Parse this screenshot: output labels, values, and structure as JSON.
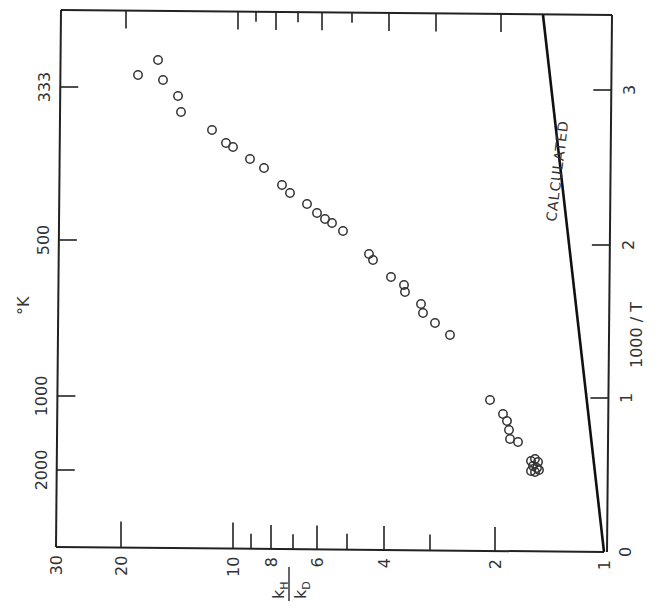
{
  "chart_data": {
    "type": "scatter",
    "orientation_note": "figure printed rotated 90 degrees counter-clockwise",
    "title": "",
    "xlabel": "1000/T",
    "ylabel": "kH/kD",
    "top_axis_label": "°K",
    "x_scale": "linear",
    "y_scale": "log",
    "xlim": [
      0,
      3.5
    ],
    "ylim": [
      1,
      30
    ],
    "x_ticks": [
      0,
      1,
      2,
      3
    ],
    "x_tick_labels": [
      "0",
      "1",
      "2",
      "3"
    ],
    "y_ticks": [
      1,
      2,
      3,
      4,
      5,
      6,
      7,
      8,
      9,
      10,
      20,
      30
    ],
    "y_tick_labels": [
      "1",
      "2",
      "",
      "4",
      "",
      "6",
      "",
      "8",
      "",
      "10",
      "20",
      "30"
    ],
    "secondary_x_ticks": [
      333,
      500,
      1000,
      2000
    ],
    "secondary_x_tick_labels": [
      "333",
      "500",
      "1000",
      "2000"
    ],
    "grid": false,
    "series": [
      {
        "name": "experimental",
        "marker": "open-circle",
        "points": [
          [
            3.1,
            18.0
          ],
          [
            3.19,
            15.9
          ],
          [
            3.06,
            15.4
          ],
          [
            2.96,
            14.1
          ],
          [
            2.86,
            13.8
          ],
          [
            2.74,
            11.4
          ],
          [
            2.66,
            10.4
          ],
          [
            2.63,
            10.0
          ],
          [
            2.55,
            9.0
          ],
          [
            2.49,
            8.3
          ],
          [
            2.38,
            7.4
          ],
          [
            2.33,
            7.0
          ],
          [
            2.26,
            6.3
          ],
          [
            2.2,
            5.9
          ],
          [
            2.16,
            5.7
          ],
          [
            2.14,
            5.4
          ],
          [
            2.08,
            5.1
          ],
          [
            1.94,
            4.3
          ],
          [
            1.9,
            4.2
          ],
          [
            1.79,
            3.75
          ],
          [
            1.73,
            3.46
          ],
          [
            1.69,
            3.44
          ],
          [
            1.61,
            3.11
          ],
          [
            1.55,
            3.08
          ],
          [
            1.49,
            2.85
          ],
          [
            1.41,
            2.6
          ],
          [
            0.99,
            2.03
          ],
          [
            0.9,
            1.87
          ],
          [
            0.85,
            1.83
          ],
          [
            0.79,
            1.8
          ],
          [
            0.73,
            1.79
          ],
          [
            0.71,
            1.71
          ],
          [
            0.6,
            1.58
          ],
          [
            0.58,
            1.54
          ],
          [
            0.57,
            1.61
          ],
          [
            0.55,
            1.56
          ],
          [
            0.54,
            1.52
          ],
          [
            0.53,
            1.59
          ],
          [
            0.52,
            1.55
          ],
          [
            0.56,
            1.5
          ]
        ]
      },
      {
        "name": "CALCULATED",
        "type": "line",
        "points": [
          [
            0,
            1.0
          ],
          [
            3.49,
            1.46
          ]
        ]
      }
    ],
    "annotations": [
      "CALCULATED"
    ]
  },
  "labels": {
    "y_axis_label_num": "k",
    "y_axis_label_num_sub": "H",
    "y_axis_label_den": "k",
    "y_axis_label_den_sub": "D",
    "x_axis_label": "1000 / T",
    "top_axis_label": "°K",
    "calculated": "CALCULATED"
  },
  "ticks": {
    "bottom": [
      {
        "label": "30",
        "x": 56,
        "len": 0
      },
      {
        "label": "20",
        "x": 121,
        "len": 26
      },
      {
        "label": "10",
        "x": 233,
        "len": 26
      },
      {
        "label": "",
        "x": 251,
        "len": 15
      },
      {
        "label": "8",
        "x": 271,
        "len": 24
      },
      {
        "label": "",
        "x": 293,
        "len": 15
      },
      {
        "label": "6",
        "x": 317,
        "len": 24
      },
      {
        "label": "",
        "x": 347,
        "len": 16
      },
      {
        "label": "4",
        "x": 384,
        "len": 24
      },
      {
        "label": "",
        "x": 430,
        "len": 16
      },
      {
        "label": "2",
        "x": 495,
        "len": 24
      },
      {
        "label": "1",
        "x": 604,
        "len": 0
      }
    ],
    "top": [
      {
        "x": 126,
        "len": 18
      },
      {
        "x": 238,
        "len": 18
      },
      {
        "x": 256,
        "len": 10
      },
      {
        "x": 276,
        "len": 18
      },
      {
        "x": 298,
        "len": 10
      },
      {
        "x": 322,
        "len": 18
      },
      {
        "x": 352,
        "len": 10
      },
      {
        "x": 389,
        "len": 18
      },
      {
        "x": 436,
        "len": 18
      },
      {
        "x": 501,
        "len": 18
      }
    ],
    "left": [
      {
        "label": "333",
        "y": 87
      },
      {
        "label": "500",
        "y": 240
      },
      {
        "label": "1000",
        "y": 396
      },
      {
        "label": "2000",
        "y": 470
      }
    ],
    "right": [
      {
        "label": "3",
        "y": 90
      },
      {
        "label": "2",
        "y": 245
      },
      {
        "label": "1",
        "y": 398
      },
      {
        "label": "0",
        "y": 552
      }
    ]
  },
  "points_px": [
    [
      138,
      75
    ],
    [
      158,
      60
    ],
    [
      163,
      80
    ],
    [
      178,
      96
    ],
    [
      181,
      112
    ],
    [
      212,
      130
    ],
    [
      226,
      143
    ],
    [
      233,
      147
    ],
    [
      250,
      159
    ],
    [
      264,
      168
    ],
    [
      282,
      185
    ],
    [
      290,
      193
    ],
    [
      307,
      204
    ],
    [
      317,
      213
    ],
    [
      325,
      219
    ],
    [
      332,
      223
    ],
    [
      343,
      231
    ],
    [
      369,
      254
    ],
    [
      373,
      260
    ],
    [
      391,
      277
    ],
    [
      404,
      285
    ],
    [
      405,
      292
    ],
    [
      421,
      304
    ],
    [
      423,
      313
    ],
    [
      435,
      323
    ],
    [
      450,
      335
    ],
    [
      490,
      400
    ],
    [
      503,
      414
    ],
    [
      507,
      421
    ],
    [
      509,
      430
    ],
    [
      510,
      439
    ],
    [
      518,
      442
    ],
    [
      531,
      461
    ],
    [
      535,
      459
    ],
    [
      538,
      462
    ],
    [
      533,
      466
    ],
    [
      537,
      468
    ],
    [
      531,
      471
    ],
    [
      535,
      472
    ],
    [
      539,
      470
    ]
  ]
}
